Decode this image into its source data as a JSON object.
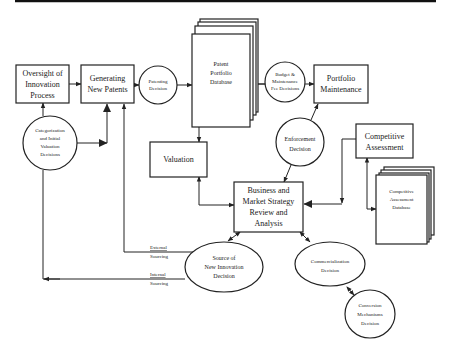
{
  "diagram": {
    "nodes": {
      "oversight": {
        "lines": [
          "Oversight of",
          "Innovation",
          "Process"
        ],
        "shape": "box"
      },
      "generating": {
        "lines": [
          "Generating",
          "New Patents"
        ],
        "shape": "box"
      },
      "patenting": {
        "lines": [
          "Patenting",
          "Decision"
        ],
        "shape": "circle"
      },
      "patent_db": {
        "lines": [
          "Patent",
          "Portfolio",
          "Database"
        ],
        "shape": "stacked-document"
      },
      "budget": {
        "lines": [
          "Budget &",
          "Maintenance",
          "Fee Decisions"
        ],
        "shape": "circle"
      },
      "maintenance": {
        "lines": [
          "Portfolio",
          "Maintenance"
        ],
        "shape": "box"
      },
      "categorization": {
        "lines": [
          "Categorization",
          "and Initial",
          "Valuation",
          "Decisions"
        ],
        "shape": "circle"
      },
      "valuation": {
        "lines": [
          "Valuation"
        ],
        "shape": "box"
      },
      "enforcement": {
        "lines": [
          "Enforcement",
          "Decision"
        ],
        "shape": "circle"
      },
      "competitive": {
        "lines": [
          "Competitive",
          "Assessment"
        ],
        "shape": "box"
      },
      "competitive_db": {
        "lines": [
          "Competitive",
          "Assessment",
          "Database"
        ],
        "shape": "stacked-document"
      },
      "business": {
        "lines": [
          "Business and",
          "Market Strategy",
          "Review and",
          "Analysis"
        ],
        "shape": "box"
      },
      "source": {
        "lines": [
          "Source of",
          "New Innovation",
          "Decision"
        ],
        "shape": "ellipse"
      },
      "commercialization": {
        "lines": [
          "Commercialization",
          "Decision"
        ],
        "shape": "ellipse"
      },
      "conversion": {
        "lines": [
          "Conversion",
          "Mechanisms",
          "Decision"
        ],
        "shape": "ellipse"
      }
    },
    "edge_labels": {
      "external": [
        "External",
        "Sourcing"
      ],
      "internal": [
        "Internal",
        "Sourcing"
      ]
    },
    "edges": [
      {
        "from": "oversight",
        "to": "generating"
      },
      {
        "from": "generating",
        "to": "patenting"
      },
      {
        "from": "patenting",
        "to": "patent_db"
      },
      {
        "from": "patent_db",
        "to": "budget"
      },
      {
        "from": "budget",
        "to": "maintenance"
      },
      {
        "from": "categorization",
        "to": "oversight"
      },
      {
        "from": "categorization",
        "to": "generating"
      },
      {
        "from": "patent_db",
        "to": "valuation"
      },
      {
        "from": "valuation",
        "to": "business",
        "bidirectional": true
      },
      {
        "from": "enforcement",
        "to": "maintenance"
      },
      {
        "from": "enforcement",
        "to": "business"
      },
      {
        "from": "competitive",
        "to": "business"
      },
      {
        "from": "competitive",
        "to": "competitive_db",
        "bidirectional": true
      },
      {
        "from": "business",
        "to": "source",
        "bidirectional": true
      },
      {
        "from": "business",
        "to": "commercialization",
        "bidirectional": true
      },
      {
        "from": "commercialization",
        "to": "conversion",
        "bidirectional": true
      },
      {
        "from": "source",
        "to": "generating",
        "label": "External Sourcing"
      },
      {
        "from": "source",
        "to": "oversight",
        "label": "Internal Sourcing"
      }
    ]
  }
}
